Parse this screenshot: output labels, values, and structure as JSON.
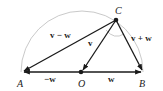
{
  "diagram": {
    "colors": {
      "vector": "#1a1a1a",
      "circle": "#bbbbbb",
      "text": "#222222"
    },
    "points": [
      {
        "id": "A",
        "label": "A",
        "x": 22,
        "y": 72
      },
      {
        "id": "O",
        "label": "O",
        "x": 81,
        "y": 72
      },
      {
        "id": "B",
        "label": "B",
        "x": 143,
        "y": 72
      },
      {
        "id": "C",
        "label": "C",
        "x": 116,
        "y": 20
      }
    ],
    "vectors": [
      {
        "id": "v-minus-w",
        "label": "v − w",
        "from": "C",
        "to": "A"
      },
      {
        "id": "v",
        "label": "v",
        "from": "C",
        "to": "O"
      },
      {
        "id": "v-plus-w",
        "label": "v + w",
        "from": "C",
        "to": "B"
      },
      {
        "id": "minus-w",
        "label": "−w",
        "from": "O",
        "to": "A"
      },
      {
        "id": "w",
        "label": "w",
        "from": "O",
        "to": "B"
      }
    ],
    "labels": {
      "A": "A",
      "O": "O",
      "B": "B",
      "C": "C",
      "v_minus_w": "v − w",
      "v": "v",
      "v_plus_w": "v + w",
      "minus_w": "−w",
      "w": "w"
    }
  }
}
